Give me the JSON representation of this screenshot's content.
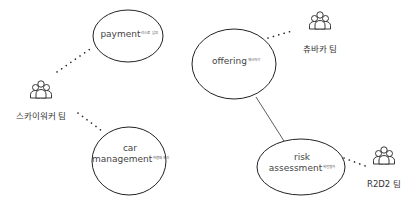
{
  "nodes": [
    {
      "id": "payment",
      "title": "payment",
      "subtitle": "리스료 납부"
    },
    {
      "id": "car_management",
      "title_line1": "car",
      "title_line2": "management",
      "subtitle": "차량의 관리"
    },
    {
      "id": "offering",
      "title": "offering",
      "subtitle": "제시하기"
    },
    {
      "id": "risk_assessment",
      "title_line1": "risk",
      "title_line2": "assessment",
      "subtitle": "위험평가"
    }
  ],
  "teams": [
    {
      "id": "skywalker",
      "label": "스카이워커 팀",
      "icon": "team-icon"
    },
    {
      "id": "chewbacca",
      "label": "츄바카 팀",
      "icon": "team-icon"
    },
    {
      "id": "r2d2",
      "label": "R2D2 팀",
      "icon": "team-icon"
    }
  ],
  "edges": [
    {
      "from": "skywalker",
      "to": "payment",
      "style": "dotted"
    },
    {
      "from": "skywalker",
      "to": "car_management",
      "style": "dotted"
    },
    {
      "from": "chewbacca",
      "to": "offering",
      "style": "dotted"
    },
    {
      "from": "r2d2",
      "to": "risk_assessment",
      "style": "dotted"
    },
    {
      "from": "offering",
      "to": "risk_assessment",
      "style": "solid"
    }
  ],
  "colors": {
    "stroke": "#222222",
    "text": "#444444"
  }
}
